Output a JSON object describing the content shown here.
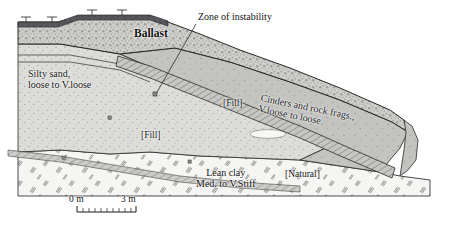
{
  "figure": {
    "kind": "geotechnical-cross-section",
    "title_visible": false
  },
  "labels": {
    "ballast": "Ballast",
    "zone_of_instability": "Zone of instability",
    "silty_sand_line1": "Silty sand,",
    "silty_sand_line2": "loose to V.loose",
    "fill_left": "[Fill]",
    "fill_right": "[Fill]",
    "cinders_line1": "Cinders and rock frags.,",
    "cinders_line2": "V.loose to loose",
    "lean_clay_line1": "Lean clay",
    "lean_clay_line2": "Med. to V.Stiff",
    "natural": "[Natural]"
  },
  "scale_bar": {
    "start_label": "0 m",
    "end_label": "3 m",
    "ticks": 10
  },
  "colors": {
    "ballast_cap": "#55565a",
    "ballast_body": "#c9c9c7",
    "silty_sand": "#d7d7d4",
    "fill_body": "#bcbcba",
    "cinders_band": "#b3b3b0",
    "natural_clay": "#f4f4f2",
    "outline": "#1d1d1d",
    "page": "#ffffff"
  }
}
